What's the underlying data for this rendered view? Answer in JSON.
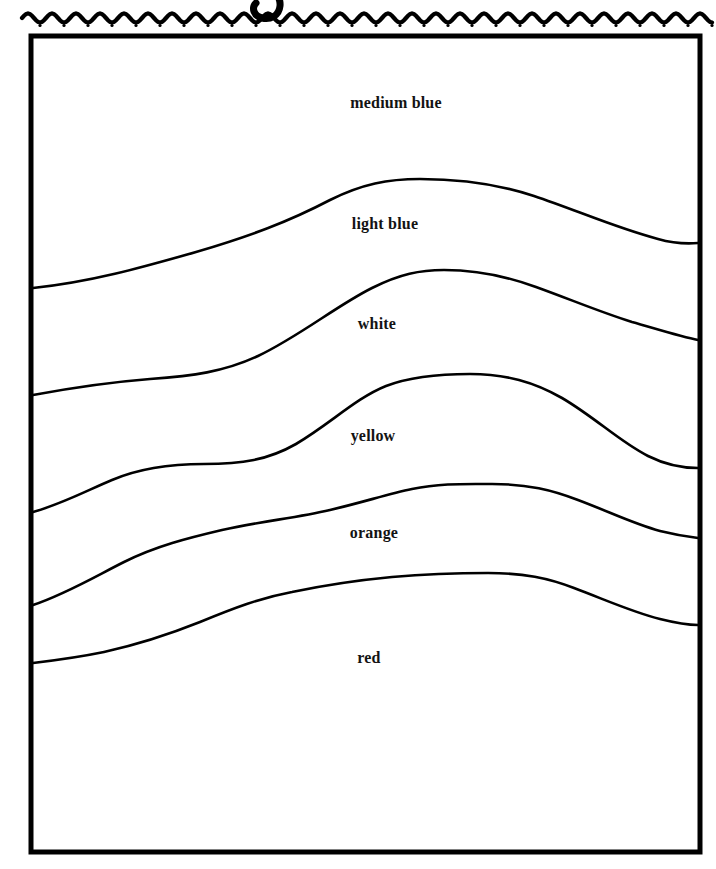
{
  "page": {
    "title_fragment": "g",
    "background_color": "#ffffff",
    "ink_color": "#000000",
    "width": 716,
    "height": 869
  },
  "decoration": {
    "wavy_rule": {
      "name": "wavy-rule",
      "description": "scalloped wavy line with dots beneath",
      "y": 18,
      "x_start": 22,
      "x_end": 712,
      "wavelength": 24,
      "amplitude": 4.5,
      "dot_radius": 1.6,
      "color": "#000000"
    }
  },
  "frame": {
    "name": "picture-frame",
    "x": 31,
    "y": 36,
    "width": 669,
    "height": 816,
    "stroke_width": 5,
    "color": "#000000"
  },
  "chart_data": {
    "type": "area",
    "xlabel": "",
    "ylabel": "",
    "orientation": "horizontal-bands",
    "grid": false,
    "legend": "inline-labels",
    "categories": [
      "medium blue",
      "light blue",
      "white",
      "yellow",
      "orange",
      "red"
    ],
    "bands": [
      {
        "label": "medium blue",
        "label_x": 396,
        "label_y": 103,
        "color_name": "medium blue",
        "swatch": "#2a4fb8",
        "boundary_below": 0
      },
      {
        "label": "light blue",
        "label_x": 385,
        "label_y": 224,
        "color_name": "light blue",
        "swatch": "#8ec6ea",
        "boundary_below": 1
      },
      {
        "label": "white",
        "label_x": 377,
        "label_y": 324,
        "color_name": "white",
        "swatch": "#ffffff",
        "boundary_below": 2
      },
      {
        "label": "yellow",
        "label_x": 373,
        "label_y": 436,
        "color_name": "yellow",
        "swatch": "#f5e23d",
        "boundary_below": 3
      },
      {
        "label": "orange",
        "label_x": 374,
        "label_y": 533,
        "color_name": "orange",
        "swatch": "#f08a23",
        "boundary_below": 4
      },
      {
        "label": "red",
        "label_x": 369,
        "label_y": 658,
        "color_name": "red",
        "swatch": "#d8232a",
        "boundary_below": null
      }
    ],
    "boundary_curves": [
      {
        "name": "curve-medium-blue-light-blue",
        "left_y": 288,
        "right_y": 243,
        "peak_y": 180,
        "peak_x": 420,
        "path": "M 33,288 C 90,282 140,268 196,252 C 250,236 288,222 330,200 C 362,184 388,179 420,179 C 462,179 498,184 534,196 C 576,210 616,228 658,239 C 672,243 686,244 698,243"
      },
      {
        "name": "curve-light-blue-white",
        "left_y": 395,
        "right_y": 340,
        "peak_y": 274,
        "peak_x": 440,
        "path": "M 33,395 C 76,387 112,382 150,379 C 192,376 224,372 258,356 C 300,336 336,306 372,288 C 400,274 420,270 444,270 C 478,270 506,276 536,287 C 572,300 600,312 632,322 C 660,330 682,337 698,340"
      },
      {
        "name": "curve-white-yellow",
        "left_y": 512,
        "right_y": 468,
        "peak_y": 378,
        "peak_x": 470,
        "path": "M 33,512 C 62,504 88,490 112,480 C 140,468 170,464 204,464 C 242,464 268,460 296,444 C 330,424 356,398 386,386 C 412,376 440,374 470,374 C 506,374 534,382 562,398 C 596,418 620,442 648,456 C 666,465 684,468 698,468"
      },
      {
        "name": "curve-yellow-orange",
        "left_y": 605,
        "right_y": 538,
        "peak_y": 487,
        "peak_x": 490,
        "path": "M 33,605 C 66,594 96,576 124,562 C 156,546 188,538 222,530 C 262,521 296,518 330,510 C 364,502 388,494 412,489 C 440,483 466,484 492,484 C 528,484 552,490 578,500 C 610,512 634,524 660,531 C 676,535 690,537 698,538"
      },
      {
        "name": "curve-orange-red",
        "left_y": 663,
        "right_y": 625,
        "peak_y": 576,
        "peak_x": 490,
        "path": "M 33,663 C 58,660 80,657 104,652 C 140,644 170,634 200,622 C 234,608 260,598 292,592 C 330,584 360,580 392,577 C 426,574 456,573 488,573 C 524,573 548,578 574,588 C 606,600 632,612 660,619 C 676,623 690,625 698,625"
      }
    ]
  }
}
